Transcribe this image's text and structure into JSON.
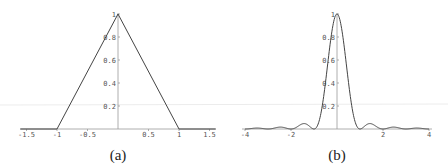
{
  "chart_data": [
    {
      "type": "line",
      "caption": "(a)",
      "title": "",
      "xlabel": "",
      "ylabel": "",
      "xlim": [
        -1.6,
        1.6
      ],
      "ylim": [
        0,
        1
      ],
      "x_ticks": [
        -1.5,
        -1,
        -0.5,
        0.5,
        1,
        1.5
      ],
      "x_tick_labels": [
        "-1.5",
        "-1",
        "-0.5",
        "0.5",
        "1",
        "1.5"
      ],
      "y_ticks": [
        0.2,
        0.4,
        0.6,
        0.8,
        1
      ],
      "y_tick_labels": [
        "0.2",
        "0.4",
        "0.6",
        "0.8",
        "1"
      ],
      "grid": false,
      "series": [
        {
          "name": "triangle",
          "x": [
            -1.6,
            -1,
            0,
            1,
            1.6
          ],
          "y": [
            0,
            0,
            1,
            0,
            0
          ]
        }
      ]
    },
    {
      "type": "line",
      "caption": "(b)",
      "title": "",
      "xlabel": "",
      "ylabel": "",
      "xlim": [
        -4.2,
        4.2
      ],
      "ylim": [
        0,
        1
      ],
      "x_ticks": [
        -4,
        -2,
        2,
        4
      ],
      "x_tick_labels": [
        "-4",
        "-2",
        "2",
        "4"
      ],
      "y_ticks": [
        0.2,
        0.4,
        0.6,
        0.8,
        1
      ],
      "y_tick_labels": [
        "0.2",
        "0.4",
        "0.6",
        "0.8",
        "1"
      ],
      "grid": false,
      "series": [
        {
          "name": "sinc squared",
          "function": "(sin(pi x)/(pi x))^2",
          "x": [
            -4,
            -3.5,
            -3,
            -2.5,
            -2,
            -1.43,
            -1,
            -0.75,
            -0.5,
            -0.25,
            0,
            0.25,
            0.5,
            0.75,
            1,
            1.43,
            2,
            2.5,
            3,
            3.5,
            4
          ],
          "y": [
            0,
            0.0083,
            0,
            0.0162,
            0,
            0.047,
            0,
            0.09,
            0.405,
            0.811,
            1,
            0.811,
            0.405,
            0.09,
            0,
            0.047,
            0,
            0.0162,
            0,
            0.0083,
            0
          ]
        }
      ]
    }
  ]
}
